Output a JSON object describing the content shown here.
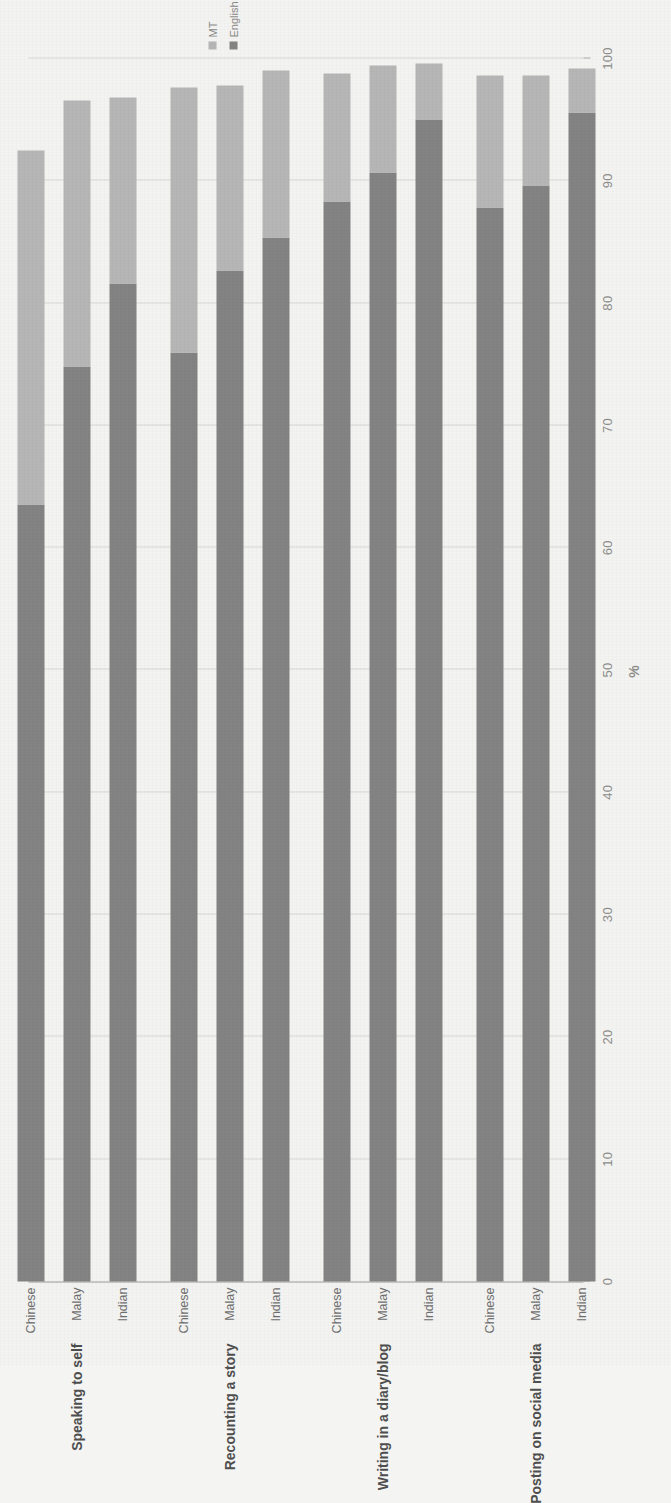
{
  "chart_data": {
    "type": "bar",
    "title": "",
    "subtitle": "",
    "orientation": "horizontal-stacked",
    "stacked": true,
    "xlabel": "%",
    "ylabel": "",
    "xlim": [
      0,
      100
    ],
    "xticks": [
      0,
      10,
      20,
      30,
      40,
      50,
      60,
      70,
      80,
      90,
      100
    ],
    "xtick_labels": [
      "0",
      "10",
      "20",
      "30",
      "40",
      "50",
      "60",
      "70",
      "80",
      "90",
      "100"
    ],
    "grid": true,
    "legend_position": "top-right",
    "legend": [
      "MT",
      "English"
    ],
    "series": [
      {
        "name": "English",
        "color": "#838383",
        "values": [
          63.5,
          74.8,
          81.6,
          76.0,
          82.7,
          85.4,
          88.3,
          90.7,
          95.0,
          87.8,
          89.6,
          95.6
        ]
      },
      {
        "name": "MT",
        "color": "#b6b6b6",
        "values": [
          29.0,
          21.8,
          15.2,
          21.6,
          15.1,
          13.6,
          10.5,
          8.7,
          4.6,
          10.8,
          9.0,
          3.6
        ]
      }
    ],
    "groups": [
      {
        "label": "Speaking to self",
        "categories": [
          "Chinese",
          "Malay",
          "Indian"
        ],
        "english": [
          63.5,
          74.8,
          81.6
        ],
        "mt": [
          29.0,
          21.8,
          15.2
        ],
        "totals": [
          92.5,
          96.6,
          96.8
        ]
      },
      {
        "label": "Recounting a story",
        "categories": [
          "Chinese",
          "Malay",
          "Indian"
        ],
        "english": [
          76.0,
          82.7,
          85.4
        ],
        "mt": [
          21.6,
          15.1,
          13.6
        ],
        "totals": [
          97.6,
          97.8,
          99.0
        ]
      },
      {
        "label": "Writing in a diary/blog",
        "categories": [
          "Chinese",
          "Malay",
          "Indian"
        ],
        "english": [
          88.3,
          90.7,
          95.0
        ],
        "mt": [
          10.5,
          8.7,
          4.6
        ],
        "totals": [
          98.8,
          99.4,
          99.6
        ]
      },
      {
        "label": "Posting on social media",
        "categories": [
          "Chinese",
          "Malay",
          "Indian"
        ],
        "english": [
          87.8,
          89.6,
          95.6
        ],
        "mt": [
          10.8,
          9.0,
          3.6
        ],
        "totals": [
          98.6,
          98.6,
          99.2
        ]
      }
    ]
  },
  "axis": {
    "x_title": "%",
    "tick_labels": [
      "0",
      "10",
      "20",
      "30",
      "40",
      "50",
      "60",
      "70",
      "80",
      "90",
      "100"
    ]
  },
  "legend": {
    "items": [
      {
        "label": "MT",
        "color": "#b6b6b6",
        "icon": "square-swatch-icon"
      },
      {
        "label": "English",
        "color": "#838383",
        "icon": "square-swatch-icon"
      }
    ]
  },
  "colors": {
    "mt": "#b6b6b6",
    "english": "#838383",
    "grid": "#d8d8d6",
    "axis": "#9a9a9a",
    "text": "#6f6f6f",
    "group_text": "#4e4e4e",
    "background": "#f3f3f1"
  }
}
